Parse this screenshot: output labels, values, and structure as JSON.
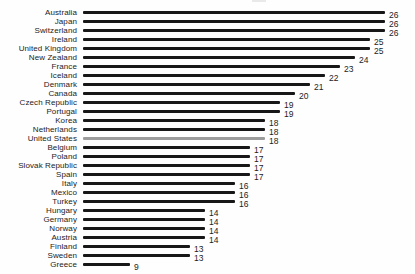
{
  "chart_data": {
    "type": "bar",
    "orientation": "horizontal",
    "title": "",
    "xlabel": "",
    "ylabel": "",
    "xlim": [
      0,
      26
    ],
    "gridlines": false,
    "legend": "none",
    "value_labels_shown": true,
    "bar_color": "#171717",
    "highlight_color": "#9c9c9c",
    "text_color": "#1c1c1c",
    "highlight_category": "United States",
    "categories": [
      "Australia",
      "Japan",
      "Switzerland",
      "Ireland",
      "United Kingdom",
      "New Zealand",
      "France",
      "Iceland",
      "Denmark",
      "Canada",
      "Czech Republic",
      "Portugal",
      "Korea",
      "Netherlands",
      "United States",
      "Belgium",
      "Poland",
      "Slovak Republic",
      "Spain",
      "Italy",
      "Mexico",
      "Turkey",
      "Hungary",
      "Germany",
      "Norway",
      "Austria",
      "Finland",
      "Sweden",
      "Greece"
    ],
    "values": [
      26,
      26,
      26,
      25,
      25,
      24,
      23,
      22,
      21,
      20,
      19,
      19,
      18,
      18,
      18,
      17,
      17,
      17,
      17,
      16,
      16,
      16,
      14,
      14,
      14,
      14,
      13,
      13,
      9
    ]
  }
}
